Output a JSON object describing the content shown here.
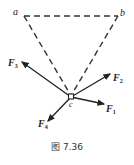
{
  "diagram": {
    "points": {
      "a": {
        "label": "a"
      },
      "b": {
        "label": "b"
      },
      "c": {
        "label": "c"
      }
    },
    "forces": [
      {
        "name": "F",
        "sub": "1"
      },
      {
        "name": "F",
        "sub": "2"
      },
      {
        "name": "F",
        "sub": "3"
      },
      {
        "name": "F",
        "sub": "4"
      }
    ],
    "caption": "图 7.36"
  }
}
